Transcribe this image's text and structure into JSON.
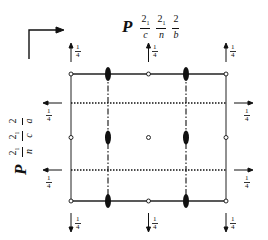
{
  "diagram": {
    "top_symbol": {
      "lattice": "P",
      "parts": [
        {
          "num": "2",
          "sub": "1",
          "den": "c"
        },
        {
          "num": "2",
          "sub": "1",
          "den": "n"
        },
        {
          "num": "2",
          "sub": "",
          "den": "b"
        }
      ]
    },
    "left_symbol": {
      "lattice": "P",
      "parts": [
        {
          "num": "2",
          "sub": "1",
          "den": "n"
        },
        {
          "num": "2",
          "sub": "1",
          "den": "c"
        },
        {
          "num": "2",
          "sub": "",
          "den": "a"
        }
      ]
    },
    "height_label": {
      "num": "1",
      "den": "4"
    },
    "colors": {
      "ink": "#111111",
      "background": "#ffffff"
    },
    "cell": {
      "x0": 71,
      "y0": 74,
      "x1": 226,
      "y1": 201
    },
    "glide_planes_y": [
      103,
      170
    ],
    "twofold_axes_x": [
      108,
      186
    ],
    "top_arrows_x": [
      71,
      148,
      226
    ],
    "bottom_arrows_x": [
      71,
      148,
      226
    ],
    "side_arrows_y": [
      103,
      170
    ]
  }
}
